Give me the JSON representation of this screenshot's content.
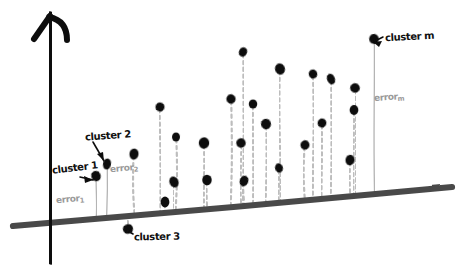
{
  "figure": {
    "background_color": "#ffffff",
    "style": "hand-drawn whiteboard sketch",
    "width": 463,
    "height": 277
  },
  "axes": {
    "y_axis": {
      "name": "vertical-axis",
      "color": "#111111",
      "has_arrowhead": true,
      "x": 50,
      "y_top": 14,
      "y_bottom": 262
    },
    "baseline": {
      "name": "slanted-baseline",
      "color": "#4a4a4a",
      "description": "thick slanted trend line",
      "x1": 13,
      "y1": 226,
      "x2": 452,
      "y2": 187
    }
  },
  "colors": {
    "ink": "#111111",
    "baseline": "#4a4a4a",
    "stem_dashed": "#bdbdbd",
    "stem_solid": "#b4b4b4",
    "label_gray": "#9a9a9a"
  },
  "labels": [
    {
      "id": "cluster1",
      "text": "cluster 1",
      "tone": "dark",
      "target": "stem 1 dot"
    },
    {
      "id": "cluster2",
      "text": "cluster 2",
      "tone": "dark",
      "target": "stem 2 dot"
    },
    {
      "id": "cluster3",
      "text": "cluster 3",
      "tone": "dark",
      "target": "stem 3 dot below baseline"
    },
    {
      "id": "clusterm",
      "text": "cluster m",
      "tone": "dark",
      "target": "rightmost top dot"
    },
    {
      "id": "error1",
      "text": "error",
      "subscript": "1",
      "tone": "gray",
      "target": "solid stem 1"
    },
    {
      "id": "error2",
      "text": "error",
      "subscript": "2",
      "tone": "gray",
      "target": "solid stem 2"
    },
    {
      "id": "errorm",
      "text": "error",
      "subscript": "m",
      "tone": "gray",
      "target": "solid stem m"
    }
  ],
  "chart_data": {
    "type": "scatter",
    "title": "",
    "subtitle": "",
    "xlabel": "",
    "ylabel": "",
    "grid": false,
    "legend": null,
    "baseline_equation_hint": "baseline slopes upward to the right",
    "stem_styles": {
      "solid": "annotated error stems",
      "dashed": "ordinary residual stems"
    },
    "points": [
      {
        "id": 1,
        "x": 96,
        "y": 176,
        "stem": "solid",
        "baseline_y": 218,
        "label": "cluster 1"
      },
      {
        "id": 2,
        "x": 107,
        "y": 164,
        "stem": "solid",
        "baseline_y": 217,
        "label": "cluster 2"
      },
      {
        "id": 3,
        "x": 134,
        "y": 154,
        "stem": "dashed",
        "baseline_y": 215,
        "label": null
      },
      {
        "id": 4,
        "x": 128,
        "y": 229,
        "stem": "dashed",
        "baseline_y": 215,
        "label": "cluster 3"
      },
      {
        "id": 5,
        "x": 160,
        "y": 107,
        "stem": "dashed",
        "baseline_y": 212,
        "label": null
      },
      {
        "id": 6,
        "x": 165,
        "y": 202,
        "stem": "dashed",
        "baseline_y": 212,
        "label": null
      },
      {
        "id": 7,
        "x": 176,
        "y": 137,
        "stem": "dashed",
        "baseline_y": 211,
        "label": null
      },
      {
        "id": 8,
        "x": 174,
        "y": 182,
        "stem": "dashed",
        "baseline_y": 211,
        "label": null
      },
      {
        "id": 9,
        "x": 204,
        "y": 143,
        "stem": "dashed",
        "baseline_y": 208,
        "label": null
      },
      {
        "id": 10,
        "x": 207,
        "y": 180,
        "stem": "dashed",
        "baseline_y": 208,
        "label": null
      },
      {
        "id": 11,
        "x": 231,
        "y": 99,
        "stem": "dashed",
        "baseline_y": 206,
        "label": null
      },
      {
        "id": 12,
        "x": 243,
        "y": 52,
        "stem": "dashed",
        "baseline_y": 205,
        "label": null
      },
      {
        "id": 13,
        "x": 241,
        "y": 143,
        "stem": "dashed",
        "baseline_y": 205,
        "label": null
      },
      {
        "id": 14,
        "x": 244,
        "y": 181,
        "stem": "dashed",
        "baseline_y": 205,
        "label": null
      },
      {
        "id": 15,
        "x": 253,
        "y": 104,
        "stem": "dashed",
        "baseline_y": 204,
        "label": null
      },
      {
        "id": 16,
        "x": 266,
        "y": 124,
        "stem": "dashed",
        "baseline_y": 203,
        "label": null
      },
      {
        "id": 17,
        "x": 280,
        "y": 69,
        "stem": "dashed",
        "baseline_y": 202,
        "label": null
      },
      {
        "id": 18,
        "x": 279,
        "y": 168,
        "stem": "dashed",
        "baseline_y": 202,
        "label": null
      },
      {
        "id": 19,
        "x": 305,
        "y": 145,
        "stem": "dashed",
        "baseline_y": 200,
        "label": null
      },
      {
        "id": 20,
        "x": 313,
        "y": 74,
        "stem": "dashed",
        "baseline_y": 199,
        "label": null
      },
      {
        "id": 21,
        "x": 322,
        "y": 123,
        "stem": "dashed",
        "baseline_y": 199,
        "label": null
      },
      {
        "id": 22,
        "x": 331,
        "y": 79,
        "stem": "dashed",
        "baseline_y": 198,
        "label": null
      },
      {
        "id": 23,
        "x": 355,
        "y": 88,
        "stem": "dashed",
        "baseline_y": 196,
        "label": null
      },
      {
        "id": 24,
        "x": 354,
        "y": 110,
        "stem": "dashed",
        "baseline_y": 196,
        "label": null
      },
      {
        "id": 25,
        "x": 350,
        "y": 160,
        "stem": "dashed",
        "baseline_y": 196,
        "label": null
      },
      {
        "id": 26,
        "x": 374,
        "y": 39,
        "stem": "solid",
        "baseline_y": 194,
        "label": "cluster m"
      }
    ]
  }
}
